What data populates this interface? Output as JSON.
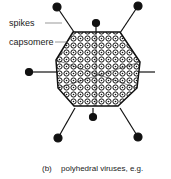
{
  "labels": {
    "spikes": "spikes",
    "capsomere": "capsomere"
  },
  "caption": {
    "marker": "(b)",
    "text": "polyhedral viruses, e.g."
  },
  "diagram": {
    "type": "polyhedral virus (icosahedral capsid) with spikes",
    "parts": [
      "spikes",
      "capsomere"
    ]
  }
}
